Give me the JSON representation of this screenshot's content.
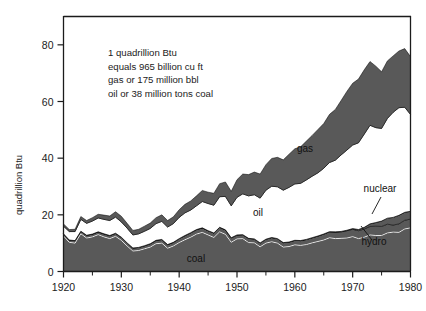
{
  "chart_data": {
    "type": "area",
    "stacked": true,
    "title": "",
    "subtitle": "",
    "xlabel": "",
    "ylabel": "quadrillion Btu",
    "xlim": [
      1920,
      1980
    ],
    "ylim": [
      0,
      90
    ],
    "yticks": [
      0,
      20,
      40,
      60,
      80
    ],
    "ytick_labels": [
      "0",
      "20",
      "40",
      "60",
      "80"
    ],
    "xticks": [
      1920,
      1930,
      1940,
      1950,
      1960,
      1970,
      1980
    ],
    "xtick_labels": [
      "1920",
      "1930",
      "1940",
      "1950",
      "1960",
      "1970",
      "1980"
    ],
    "xminorticks": [
      1925,
      1935,
      1945,
      1955,
      1965,
      1975
    ],
    "grid": false,
    "legend_position": "inline-annotations",
    "fill_color": "#595959",
    "line_color": "#000000",
    "background": "#ffffff",
    "x": [
      1920,
      1921,
      1922,
      1923,
      1924,
      1925,
      1926,
      1927,
      1928,
      1929,
      1930,
      1931,
      1932,
      1933,
      1934,
      1935,
      1936,
      1937,
      1938,
      1939,
      1940,
      1941,
      1942,
      1943,
      1944,
      1945,
      1946,
      1947,
      1948,
      1949,
      1950,
      1951,
      1952,
      1953,
      1954,
      1955,
      1956,
      1957,
      1958,
      1959,
      1960,
      1961,
      1962,
      1963,
      1964,
      1965,
      1966,
      1967,
      1968,
      1969,
      1970,
      1971,
      1972,
      1973,
      1974,
      1975,
      1976,
      1977,
      1978,
      1979,
      1980
    ],
    "series": [
      {
        "name": "coal",
        "label": "coal",
        "values": [
          12.5,
          10.3,
          10.0,
          13.3,
          11.8,
          12.2,
          13.0,
          12.2,
          11.6,
          12.4,
          11.0,
          9.0,
          7.2,
          7.4,
          8.0,
          8.6,
          9.8,
          10.0,
          8.2,
          9.0,
          10.2,
          11.2,
          12.1,
          13.2,
          13.8,
          12.9,
          12.0,
          14.0,
          13.1,
          10.3,
          11.5,
          11.6,
          10.2,
          10.1,
          8.7,
          10.0,
          10.5,
          10.0,
          8.6,
          8.8,
          9.4,
          9.2,
          9.5,
          10.1,
          10.6,
          11.1,
          11.9,
          11.6,
          11.7,
          11.8,
          12.3,
          11.6,
          12.1,
          12.9,
          12.7,
          12.7,
          13.6,
          13.9,
          13.8,
          15.0,
          15.4
        ]
      },
      {
        "name": "hydro",
        "label": "hydro",
        "values": [
          0.8,
          0.8,
          0.9,
          0.9,
          1.0,
          1.0,
          1.0,
          1.1,
          1.1,
          1.1,
          1.1,
          1.1,
          1.1,
          1.1,
          1.1,
          1.2,
          1.2,
          1.3,
          1.3,
          1.3,
          1.4,
          1.5,
          1.6,
          1.6,
          1.6,
          1.5,
          1.6,
          1.6,
          1.6,
          1.6,
          1.4,
          1.4,
          1.5,
          1.4,
          1.4,
          1.4,
          1.5,
          1.6,
          1.6,
          1.6,
          1.6,
          1.7,
          1.8,
          1.8,
          1.9,
          2.1,
          2.1,
          2.3,
          2.3,
          2.6,
          2.6,
          2.8,
          2.9,
          3.0,
          3.3,
          3.2,
          3.1,
          2.5,
          3.0,
          3.1,
          3.1
        ]
      },
      {
        "name": "oil",
        "label": "oil",
        "values": [
          2.7,
          3.0,
          3.2,
          4.2,
          4.2,
          4.6,
          4.9,
          5.1,
          5.3,
          5.7,
          5.4,
          5.2,
          4.6,
          4.8,
          5.1,
          5.4,
          5.9,
          6.4,
          6.2,
          6.6,
          7.5,
          8.0,
          8.0,
          8.4,
          9.3,
          9.6,
          9.8,
          10.8,
          11.8,
          11.3,
          13.3,
          14.4,
          15.0,
          15.6,
          15.8,
          17.3,
          18.1,
          18.3,
          18.5,
          19.3,
          19.9,
          20.2,
          21.0,
          21.7,
          22.3,
          23.2,
          24.4,
          25.3,
          27.0,
          28.3,
          29.5,
          30.6,
          32.9,
          34.8,
          33.5,
          32.7,
          35.2,
          37.1,
          38.0,
          37.1,
          34.2
        ]
      },
      {
        "name": "gas",
        "label": "gas",
        "values": [
          0.8,
          0.7,
          0.8,
          1.0,
          1.0,
          1.2,
          1.3,
          1.5,
          1.6,
          1.9,
          2.0,
          1.7,
          1.6,
          1.6,
          1.8,
          1.9,
          2.1,
          2.3,
          2.3,
          2.4,
          2.7,
          3.0,
          3.2,
          3.5,
          3.9,
          4.0,
          4.2,
          4.6,
          5.1,
          5.1,
          6.2,
          7.0,
          7.5,
          8.0,
          8.5,
          9.0,
          9.8,
          10.4,
          10.7,
          11.7,
          12.4,
          12.9,
          13.7,
          14.4,
          15.3,
          15.8,
          17.0,
          17.9,
          19.2,
          20.7,
          21.8,
          22.5,
          22.7,
          22.5,
          21.7,
          20.0,
          20.3,
          19.9,
          20.0,
          20.7,
          20.4
        ]
      },
      {
        "name": "nuclear",
        "label": "nuclear",
        "values": [
          0,
          0,
          0,
          0,
          0,
          0,
          0,
          0,
          0,
          0,
          0,
          0,
          0,
          0,
          0,
          0,
          0,
          0,
          0,
          0,
          0,
          0,
          0,
          0,
          0,
          0,
          0,
          0,
          0,
          0,
          0,
          0,
          0,
          0,
          0,
          0,
          0,
          0,
          0,
          0,
          0.01,
          0.02,
          0.03,
          0.04,
          0.04,
          0.04,
          0.06,
          0.09,
          0.14,
          0.15,
          0.24,
          0.41,
          0.58,
          0.91,
          1.27,
          1.9,
          2.11,
          2.7,
          3.02,
          2.78,
          2.74
        ]
      }
    ],
    "annotations": [
      {
        "name": "conversion-note",
        "lines": [
          "1 quadrillion Btu",
          "equals 965 billion cu ft",
          "gas or 175 million bbl",
          "oil or 38 million tons coal"
        ]
      }
    ],
    "series_labels": [
      {
        "name": "gas",
        "text": "gas",
        "x": 305,
        "y": 152,
        "leader": false
      },
      {
        "name": "oil",
        "text": "oil",
        "x": 258,
        "y": 216,
        "leader": false
      },
      {
        "name": "coal",
        "text": "coal",
        "x": 196,
        "y": 262,
        "leader": false
      },
      {
        "name": "nuclear",
        "text": "nuclear",
        "x": 380,
        "y": 192,
        "leader": true,
        "leader_path": "M 381 197 L 372 214"
      },
      {
        "name": "hydro",
        "text": "hydro",
        "x": 374,
        "y": 245,
        "leader": true,
        "leader_path": "M 372 240 L 361 226"
      }
    ]
  }
}
